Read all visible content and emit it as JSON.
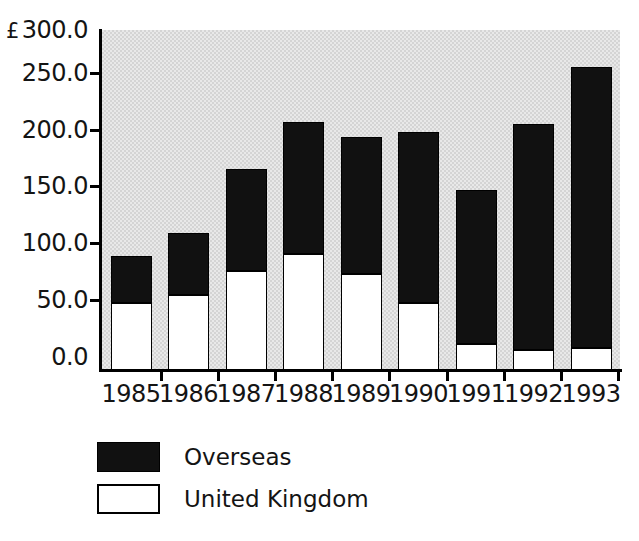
{
  "chart_data": {
    "type": "bar",
    "subtype": "stacked-vertical",
    "title": "",
    "xlabel": "",
    "ylabel": "",
    "currency_symbol": "£",
    "categories": [
      "1985",
      "1986",
      "1987",
      "1988",
      "1989",
      "1990",
      "1991",
      "1992",
      "1993"
    ],
    "series": [
      {
        "name": "United Kingdom",
        "color": "#ffffff",
        "values": [
          59,
          66,
          87,
          102,
          85,
          59,
          23,
          18,
          19
        ]
      },
      {
        "name": "Overseas",
        "color": "#111111",
        "values": [
          42,
          55,
          90,
          117,
          121,
          151,
          136,
          199,
          248
        ]
      }
    ],
    "totals": [
      101,
      121,
      177,
      219,
      206,
      210,
      159,
      217,
      267
    ],
    "ylim": [
      0,
      300
    ],
    "yticks": [
      0,
      50,
      100,
      150,
      200,
      250,
      300
    ],
    "ytick_labels": [
      "0.0",
      "50.0",
      "100.0",
      "150.0",
      "200.0",
      "250.0",
      "300.0"
    ],
    "ytick_top_label": "£ 300.0",
    "grid": false,
    "legend_position": "below-left",
    "plot_background": "#e8e8e8"
  },
  "legend": {
    "items": [
      {
        "label": "Overseas",
        "swatch": "black-filled"
      },
      {
        "label": "United Kingdom",
        "swatch": "white-outlined"
      }
    ]
  }
}
